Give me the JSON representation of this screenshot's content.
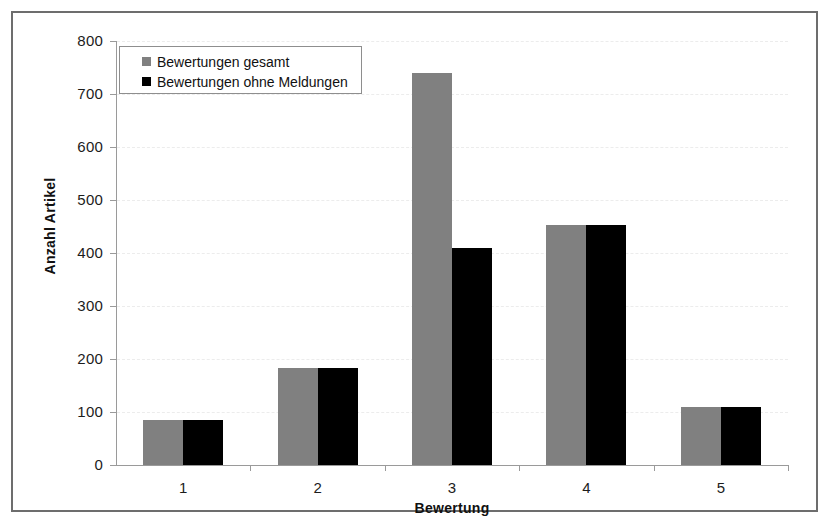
{
  "chart_data": {
    "type": "bar",
    "title": "",
    "subtitle": "",
    "xlabel": "Bewertung",
    "ylabel": "Anzahl Artikel",
    "categories": [
      "1",
      "2",
      "3",
      "4",
      "5"
    ],
    "series": [
      {
        "name": "Bewertungen gesamt",
        "color": "#808080",
        "values": [
          85,
          183,
          740,
          452,
          110
        ]
      },
      {
        "name": "Bewertungen ohne Meldungen",
        "color": "#000000",
        "values": [
          85,
          183,
          410,
          452,
          110
        ]
      }
    ],
    "ylim": [
      0,
      800
    ],
    "ytick_values": [
      0,
      100,
      200,
      300,
      400,
      500,
      600,
      700,
      800
    ],
    "ytick_labels": [
      "0",
      "100",
      "200",
      "300",
      "400",
      "500",
      "600",
      "700",
      "800"
    ],
    "grid": true,
    "grid_axis": "y",
    "legend_position": "top-left",
    "annotations": []
  },
  "legend": {
    "entries": [
      {
        "label": "Bewertungen gesamt",
        "swatch": "gray-swatch-icon"
      },
      {
        "label": "Bewertungen ohne Meldungen",
        "swatch": "black-swatch-icon"
      }
    ]
  },
  "axes": {
    "y_title": "Anzahl Artikel",
    "x_title": "Bewertung"
  },
  "colors": {
    "series_gesamt": "#808080",
    "series_ohne": "#000000",
    "frame_border": "#6d6d6d",
    "axis": "#9a9a9a",
    "gridline": "#ececec",
    "background": "#ffffff"
  }
}
